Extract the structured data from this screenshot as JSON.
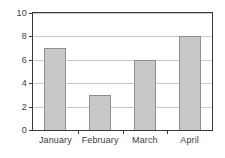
{
  "chart_data": {
    "type": "bar",
    "title": "",
    "subtitle": "",
    "xlabel": "",
    "ylabel": "",
    "categories": [
      "January",
      "February",
      "March",
      "April"
    ],
    "values": [
      7,
      3,
      6,
      8
    ],
    "series": [
      {
        "name": "",
        "values": [
          7,
          3,
          6,
          8
        ]
      }
    ],
    "ylim": [
      0,
      10
    ],
    "yticks": [
      0,
      2,
      4,
      6,
      8,
      10
    ],
    "ytick_labels": [
      "0",
      "2",
      "4",
      "6",
      "8",
      "10"
    ],
    "grid": true,
    "grid_axis": "y",
    "legend": false,
    "legend_position": "none",
    "bar_fill_color": "#c8c8c8",
    "bar_edge_color": "#8e8e8e",
    "grid_color": "#c9c9c9",
    "axis_color": "#3a3a3a",
    "text_color": "#3c3c3c",
    "background_color": "#ffffff"
  }
}
